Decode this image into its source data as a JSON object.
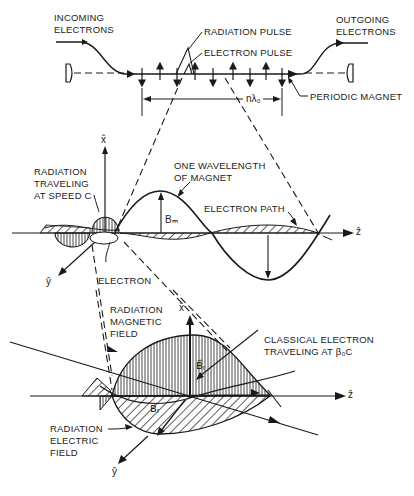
{
  "figure": {
    "top_panel": {
      "incoming_label": "INCOMING\nELECTRONS",
      "outgoing_label": "OUTGOING\nELECTRONS",
      "radiation_pulse_label": "RADIATION PULSE",
      "electron_pulse_label": "ELECTRON PULSE",
      "periodic_magnet_label": "PERIODIC MAGNET",
      "length_label": "nλ₀"
    },
    "middle_panel": {
      "radiation_label": "RADIATION\nTRAVELING\nAT SPEED C",
      "wavelength_label": "ONE WAVELENGTH\nOF MAGNET",
      "electron_path_label": "ELECTRON PATH",
      "bm_label": "Bₘ",
      "electron_label": "ELECTRON",
      "axis_x": "x̂",
      "axis_y": "ŷ",
      "axis_z": "ẑ"
    },
    "bottom_panel": {
      "magnetic_field_label": "RADIATION\nMAGNETIC\nFIELD",
      "classical_electron_label": "CLASSICAL ELECTRON\nTRAVELING AT β₀C",
      "electric_field_label": "RADIATION\nELECTRIC\nFIELD",
      "br_upper": "B⃗ᵣ",
      "br_lower": "B⃗ᵣ",
      "axis_x": "x̂",
      "axis_y": "ŷ",
      "axis_z": "ẑ"
    }
  }
}
